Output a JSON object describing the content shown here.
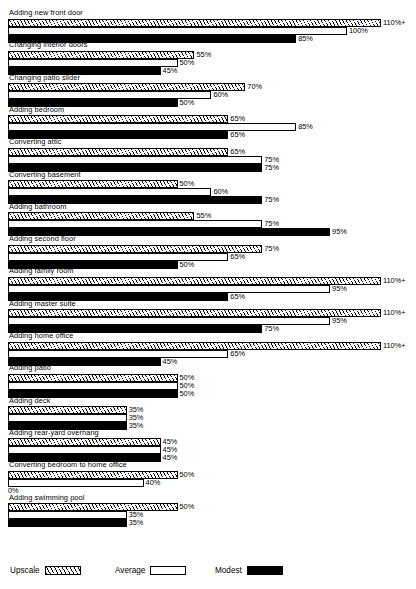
{
  "chart_data": {
    "type": "bar",
    "orientation": "horizontal",
    "title": "",
    "xlabel": "",
    "ylabel": "",
    "xlim": [
      0,
      110
    ],
    "grid": false,
    "legend_position": "bottom",
    "value_suffix": "%",
    "max_label": "110%+",
    "categories": [
      "Adding new front door",
      "Changing interior doors",
      "Changing patio slider",
      "Adding bedroom",
      "Converting attic",
      "Converting basement",
      "Adding bathroom",
      "Adding second floor",
      "Adding family room",
      "Adding master suite",
      "Adding home office",
      "Adding patio",
      "Adding deck",
      "Adding rear-yard overhang",
      "Converting bedroom to home office",
      "Adding swimming pool"
    ],
    "series": [
      {
        "name": "Upscale",
        "swatch": "hatched",
        "values": [
          110,
          55,
          70,
          65,
          65,
          50,
          55,
          75,
          110,
          110,
          110,
          50,
          35,
          45,
          50,
          50
        ],
        "labels": [
          "110%+",
          "55%",
          "70%",
          "65%",
          "65%",
          "50%",
          "55%",
          "75%",
          "110%+",
          "110%+",
          "110%+",
          "50%",
          "35%",
          "45%",
          "50%",
          "50%"
        ]
      },
      {
        "name": "Average",
        "swatch": "outline",
        "values": [
          100,
          50,
          60,
          85,
          75,
          60,
          75,
          65,
          95,
          95,
          65,
          50,
          35,
          45,
          40,
          35
        ],
        "labels": [
          "100%",
          "50%",
          "60%",
          "85%",
          "75%",
          "60%",
          "75%",
          "65%",
          "95%",
          "95%",
          "65%",
          "50%",
          "35%",
          "45%",
          "40%",
          "35%"
        ]
      },
      {
        "name": "Modest",
        "swatch": "solid",
        "values": [
          85,
          45,
          50,
          65,
          75,
          75,
          95,
          50,
          65,
          75,
          45,
          50,
          35,
          45,
          0,
          35
        ],
        "labels": [
          "85%",
          "45%",
          "50%",
          "65%",
          "75%",
          "75%",
          "95%",
          "50%",
          "65%",
          "75%",
          "45%",
          "50%",
          "35%",
          "45%",
          "0%",
          "35%"
        ]
      }
    ]
  },
  "legend": {
    "items": [
      {
        "label": "Upscale",
        "swatch": "hatched"
      },
      {
        "label": "Average",
        "swatch": "outline"
      },
      {
        "label": "Modest",
        "swatch": "solid"
      }
    ]
  }
}
